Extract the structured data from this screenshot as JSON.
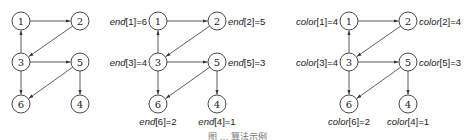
{
  "diagram": {
    "panels": [
      {
        "name": "graph",
        "offset_x": 0,
        "nodes": [
          {
            "id": "1",
            "x": 21,
            "y": 21
          },
          {
            "id": "2",
            "x": 80,
            "y": 21
          },
          {
            "id": "3",
            "x": 21,
            "y": 62
          },
          {
            "id": "5",
            "x": 80,
            "y": 62
          },
          {
            "id": "6",
            "x": 21,
            "y": 104
          },
          {
            "id": "4",
            "x": 80,
            "y": 104
          }
        ],
        "labels": []
      },
      {
        "name": "end-values",
        "offset_x": 137,
        "var": "end",
        "labels": [
          {
            "node": "1",
            "index": "1",
            "value": "6",
            "pos": "left"
          },
          {
            "node": "2",
            "index": "2",
            "value": "5",
            "pos": "right"
          },
          {
            "node": "3",
            "index": "3",
            "value": "4",
            "pos": "left"
          },
          {
            "node": "5",
            "index": "5",
            "value": "3",
            "pos": "right"
          },
          {
            "node": "6",
            "index": "6",
            "value": "2",
            "pos": "below"
          },
          {
            "node": "4",
            "index": "4",
            "value": "1",
            "pos": "below"
          }
        ]
      },
      {
        "name": "color-values",
        "offset_x": 328,
        "var": "color",
        "labels": [
          {
            "node": "1",
            "index": "1",
            "value": "4",
            "pos": "left"
          },
          {
            "node": "2",
            "index": "2",
            "value": "4",
            "pos": "right"
          },
          {
            "node": "3",
            "index": "3",
            "value": "4",
            "pos": "left"
          },
          {
            "node": "5",
            "index": "5",
            "value": "3",
            "pos": "right"
          },
          {
            "node": "6",
            "index": "6",
            "value": "2",
            "pos": "below"
          },
          {
            "node": "4",
            "index": "4",
            "value": "1",
            "pos": "below"
          }
        ]
      }
    ],
    "edges": [
      {
        "from": "1",
        "to": "2"
      },
      {
        "from": "2",
        "to": "3"
      },
      {
        "from": "3",
        "to": "1"
      },
      {
        "from": "3",
        "to": "5"
      },
      {
        "from": "3",
        "to": "6"
      },
      {
        "from": "5",
        "to": "6"
      },
      {
        "from": "5",
        "to": "4"
      }
    ],
    "caption": "图 … 算法示例"
  }
}
